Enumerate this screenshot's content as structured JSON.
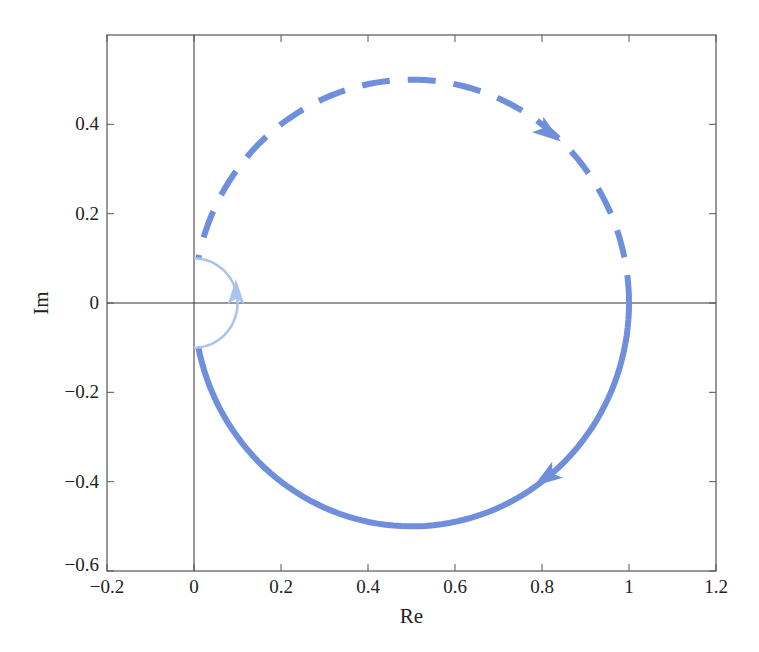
{
  "chart_data": {
    "type": "line",
    "title": "",
    "xlabel": "Re",
    "ylabel": "Im",
    "xlim": [
      -0.2,
      1.2
    ],
    "ylim": [
      -0.6,
      0.6
    ],
    "xticks": [
      "−0.2",
      "0",
      "0.2",
      "0.4",
      "0.6",
      "0.8",
      "1",
      "1.2"
    ],
    "yticks": [
      "−0.6",
      "−0.4",
      "−0.2",
      "0",
      "0.2",
      "0.4"
    ],
    "grid": false,
    "legend": null,
    "series": [
      {
        "name": "positive frequency (solid)",
        "style": "solid",
        "color": "#6f8fdc",
        "description": "Lower semicircle from (0,-0.1) to (1,0), arrow near (0.8,-0.4)",
        "x": [
          0.0,
          0.1,
          0.2,
          0.3,
          0.4,
          0.5,
          0.6,
          0.7,
          0.8,
          0.9,
          1.0
        ],
        "y": [
          -0.1,
          -0.3,
          -0.4,
          -0.46,
          -0.49,
          -0.5,
          -0.49,
          -0.46,
          -0.4,
          -0.3,
          0.0
        ]
      },
      {
        "name": "negative frequency (dashed)",
        "style": "dashed",
        "color": "#6f8fdc",
        "description": "Upper semicircle from (1,0) back to (0,0.1), arrow near (0.83,0.38)",
        "x": [
          1.0,
          0.9,
          0.8,
          0.7,
          0.6,
          0.5,
          0.4,
          0.3,
          0.2,
          0.1,
          0.0
        ],
        "y": [
          0.0,
          0.3,
          0.4,
          0.46,
          0.49,
          0.5,
          0.49,
          0.46,
          0.4,
          0.3,
          0.1
        ]
      },
      {
        "name": "small indentation arc",
        "style": "solid-thin",
        "color": "#a9c3f0",
        "description": "Small arc from (0,-0.1) through (0.1,0) to (0,0.1), arrow pointing up at (0.09,0)",
        "x": [
          0.0,
          0.07,
          0.1,
          0.07,
          0.0
        ],
        "y": [
          -0.1,
          -0.07,
          0.0,
          0.07,
          0.1
        ]
      }
    ]
  }
}
